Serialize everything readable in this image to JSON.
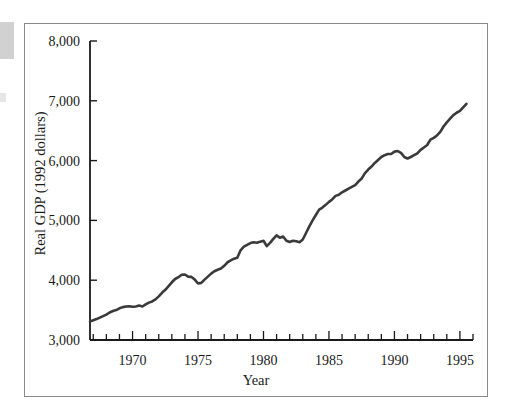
{
  "figure": {
    "background_color": "#ffffff",
    "frame_color": "#8a8a8a",
    "line_color": "#3a3a3a",
    "axis_color": "#1a1a1a",
    "artifact_color": "#c9c9c9"
  },
  "axes": {
    "ylabel": "Real GDP (1992 dollars)",
    "xlabel": "Year",
    "y_ticks": [
      "3,000",
      "4,000",
      "5,000",
      "6,000",
      "7,000",
      "8,000"
    ],
    "x_ticks": [
      "1970",
      "1975",
      "1980",
      "1985",
      "1990",
      "1995"
    ]
  },
  "chart_data": {
    "type": "line",
    "title": "",
    "subtitle": "",
    "xlabel": "Year",
    "ylabel": "Real GDP (1992 dollars)",
    "xlim": [
      1966.75,
      1996.0
    ],
    "ylim": [
      3000,
      8000
    ],
    "ytick_values": [
      3000,
      4000,
      5000,
      6000,
      7000,
      8000
    ],
    "ytick_labels": [
      "3,000",
      "4,000",
      "5,000",
      "6,000",
      "7,000",
      "8,000"
    ],
    "xtick_values": [
      1970,
      1975,
      1980,
      1985,
      1990,
      1995
    ],
    "xtick_labels": [
      "1970",
      "1975",
      "1980",
      "1985",
      "1990",
      "1995"
    ],
    "xtick_minor_step": 1,
    "grid": false,
    "legend": null,
    "annotations": [],
    "series": [
      {
        "name": "Real GDP (1992 dollars)",
        "color": "#3a3a3a",
        "line_width": 2.6,
        "x": [
          1966.75,
          1967.0,
          1967.25,
          1967.5,
          1967.75,
          1968.0,
          1968.25,
          1968.5,
          1968.75,
          1969.0,
          1969.25,
          1969.5,
          1969.75,
          1970.0,
          1970.25,
          1970.5,
          1970.75,
          1971.0,
          1971.25,
          1971.5,
          1971.75,
          1972.0,
          1972.25,
          1972.5,
          1972.75,
          1973.0,
          1973.25,
          1973.5,
          1973.75,
          1974.0,
          1974.25,
          1974.5,
          1974.75,
          1975.0,
          1975.25,
          1975.5,
          1975.75,
          1976.0,
          1976.25,
          1976.5,
          1976.75,
          1977.0,
          1977.25,
          1977.5,
          1977.75,
          1978.0,
          1978.25,
          1978.5,
          1978.75,
          1979.0,
          1979.25,
          1979.5,
          1979.75,
          1980.0,
          1980.25,
          1980.5,
          1980.75,
          1981.0,
          1981.25,
          1981.5,
          1981.75,
          1982.0,
          1982.25,
          1982.5,
          1982.75,
          1983.0,
          1983.25,
          1983.5,
          1983.75,
          1984.0,
          1984.25,
          1984.5,
          1984.75,
          1985.0,
          1985.25,
          1985.5,
          1985.75,
          1986.0,
          1986.25,
          1986.5,
          1986.75,
          1987.0,
          1987.25,
          1987.5,
          1987.75,
          1988.0,
          1988.25,
          1988.5,
          1988.75,
          1989.0,
          1989.25,
          1989.5,
          1989.75,
          1990.0,
          1990.25,
          1990.5,
          1990.75,
          1991.0,
          1991.25,
          1991.5,
          1991.75,
          1992.0,
          1992.25,
          1992.5,
          1992.75,
          1993.0,
          1993.25,
          1993.5,
          1993.75,
          1994.0,
          1994.25,
          1994.5,
          1994.75,
          1995.0,
          1995.25,
          1995.5
        ],
        "y": [
          3310,
          3330,
          3350,
          3375,
          3400,
          3425,
          3460,
          3485,
          3500,
          3530,
          3550,
          3560,
          3565,
          3555,
          3560,
          3575,
          3560,
          3595,
          3625,
          3645,
          3680,
          3730,
          3790,
          3840,
          3900,
          3965,
          4020,
          4050,
          4090,
          4095,
          4060,
          4055,
          4010,
          3945,
          3955,
          4010,
          4060,
          4110,
          4150,
          4175,
          4195,
          4240,
          4300,
          4330,
          4360,
          4375,
          4500,
          4560,
          4590,
          4620,
          4635,
          4625,
          4645,
          4660,
          4570,
          4625,
          4690,
          4750,
          4710,
          4730,
          4660,
          4640,
          4660,
          4650,
          4635,
          4680,
          4790,
          4900,
          5000,
          5090,
          5180,
          5215,
          5260,
          5310,
          5350,
          5410,
          5430,
          5470,
          5500,
          5530,
          5560,
          5590,
          5650,
          5700,
          5790,
          5850,
          5900,
          5960,
          6010,
          6060,
          6090,
          6110,
          6110,
          6150,
          6160,
          6130,
          6060,
          6035,
          6060,
          6090,
          6120,
          6180,
          6220,
          6260,
          6350,
          6380,
          6420,
          6480,
          6570,
          6640,
          6700,
          6760,
          6800,
          6830,
          6890,
          6950
        ]
      }
    ]
  }
}
